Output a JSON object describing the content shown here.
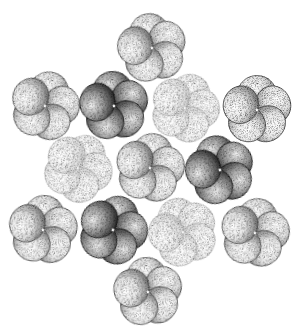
{
  "figure": {
    "width": 297,
    "height": 333,
    "background": "#ffffff",
    "stroke_color": "#2a2a2a",
    "lobe_radius": 19,
    "lobe_offset": 17,
    "shades": {
      "faint": {
        "light": "#ffffff",
        "mid": "#f4f4f4",
        "dark": "#cfcfcf",
        "stroke": "#9a9a9a",
        "stroke_width": 0.5
      },
      "light": {
        "light": "#ffffff",
        "mid": "#e6e6e6",
        "dark": "#6a6a6a",
        "stroke": "#3a3a3a",
        "stroke_width": 0.7
      },
      "dark": {
        "light": "#f2f2f2",
        "mid": "#9c9c9c",
        "dark": "#1a1a1a",
        "stroke": "#111111",
        "stroke_width": 0.8
      }
    },
    "clusters": [
      {
        "name": "cluster-top",
        "cx": 152,
        "cy": 48,
        "rot": -10,
        "shade": "light"
      },
      {
        "name": "cluster-upper-left",
        "cx": 45,
        "cy": 106,
        "rot": 15,
        "shade": "light"
      },
      {
        "name": "cluster-upper-left-dark",
        "cx": 114,
        "cy": 106,
        "rot": -5,
        "shade": "dark"
      },
      {
        "name": "cluster-upper-middle",
        "cx": 185,
        "cy": 108,
        "rot": 20,
        "shade": "faint"
      },
      {
        "name": "cluster-upper-right",
        "cx": 257,
        "cy": 110,
        "rot": 0,
        "shade": "light"
      },
      {
        "name": "cluster-middle-left",
        "cx": 78,
        "cy": 168,
        "rot": 30,
        "shade": "faint"
      },
      {
        "name": "cluster-center",
        "cx": 150,
        "cy": 168,
        "rot": 10,
        "shade": "light"
      },
      {
        "name": "cluster-right-dark",
        "cx": 220,
        "cy": 170,
        "rot": -15,
        "shade": "dark"
      },
      {
        "name": "cluster-lower-left",
        "cx": 43,
        "cy": 230,
        "rot": 5,
        "shade": "light"
      },
      {
        "name": "cluster-lower-left-dark",
        "cx": 113,
        "cy": 230,
        "rot": 20,
        "shade": "dark"
      },
      {
        "name": "cluster-lower-middle",
        "cx": 183,
        "cy": 232,
        "rot": -20,
        "shade": "faint"
      },
      {
        "name": "cluster-lower-right",
        "cx": 255,
        "cy": 233,
        "rot": 10,
        "shade": "light"
      },
      {
        "name": "cluster-bottom",
        "cx": 148,
        "cy": 292,
        "rot": -5,
        "shade": "light"
      }
    ]
  }
}
